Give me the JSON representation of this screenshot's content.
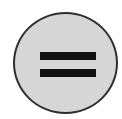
{
  "button": {
    "icon": "equals-icon",
    "symbol": "=",
    "colors": {
      "fill": "#d6d6d6",
      "border": "#2e2e2e",
      "glyph": "#111111",
      "background": "#ffffff"
    }
  }
}
